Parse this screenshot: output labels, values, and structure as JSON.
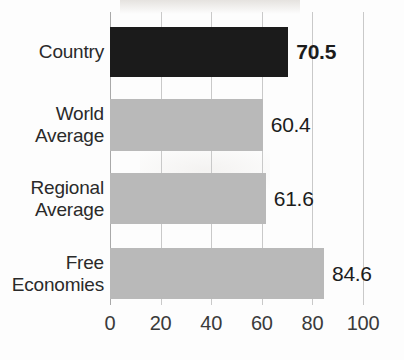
{
  "chart_data": {
    "type": "bar",
    "orientation": "horizontal",
    "title": "",
    "subtitle": "",
    "xlabel": "",
    "ylabel": "",
    "categories": [
      "Country",
      "World Average",
      "Regional Average",
      "Free Economies"
    ],
    "category_lines": [
      [
        "Country"
      ],
      [
        "World",
        "Average"
      ],
      [
        "Regional",
        "Average"
      ],
      [
        "Free",
        "Economies"
      ]
    ],
    "values": [
      70.5,
      60.4,
      61.6,
      84.6
    ],
    "value_labels": [
      "70.5",
      "60.4",
      "61.6",
      "84.6"
    ],
    "value_label_bold": [
      true,
      false,
      false,
      false
    ],
    "bar_colors": [
      "#1b1b1b",
      "#b9b9b9",
      "#b9b9b9",
      "#b9b9b9"
    ],
    "highlighted_index": 0,
    "xlim": [
      0,
      100
    ],
    "xticks": [
      0,
      20,
      40,
      60,
      80,
      100
    ],
    "xtick_labels": [
      "0",
      "20",
      "40",
      "60",
      "80",
      "100"
    ],
    "grid": true,
    "grid_axis": "x",
    "legend": false,
    "legend_position": "none",
    "colors": {
      "highlight": "#1b1b1b",
      "bar": "#b9b9b9",
      "gridline": "#c9c9c9",
      "axis": "#a9a9a9",
      "text": "#2a2a2a",
      "background": "#fdfdfd"
    }
  }
}
